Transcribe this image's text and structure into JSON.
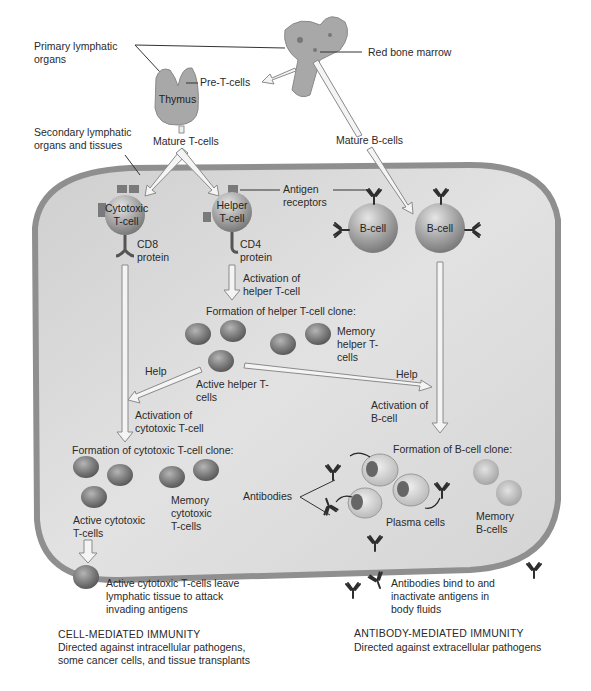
{
  "diagram": {
    "title_context": "Lymphocyte maturation and immune response",
    "colors": {
      "tissue_fill": "#d9d9d9",
      "tissue_border": "#8f8f8f",
      "cell_dark": "#8a8a8a",
      "cell_light": "#c8c8c8",
      "arrow_fill": "#f4f4f4",
      "arrow_stroke": "#8a8a8a",
      "text": "#2a2a2a",
      "background": "#ffffff"
    },
    "top": {
      "primary_organs": "Primary lymphatic organs",
      "red_bone_marrow": "Red bone marrow",
      "pre_t_cells": "Pre-T-cells",
      "thymus": "Thymus",
      "secondary_organs": "Secondary lymphatic organs and tissues",
      "mature_t_cells": "Mature T-cells",
      "mature_b_cells": "Mature B-cells"
    },
    "cells": {
      "cytotoxic_t": "Cytotoxic T-cell",
      "helper_t": "Helper T-cell",
      "b_cell_1": "B-cell",
      "b_cell_2": "B-cell",
      "cd8": "CD8 protein",
      "cd4": "CD4 protein",
      "antigen_receptors": "Antigen receptors"
    },
    "helper_path": {
      "activation": "Activation of helper T-cell",
      "clone_formation": "Formation of helper T-cell clone:",
      "memory": "Memory helper T-cells",
      "active": "Active helper T-cells",
      "help_left": "Help",
      "help_right": "Help"
    },
    "cytotoxic_path": {
      "activation": "Activation of cytotoxic T-cell",
      "clone_formation": "Formation of cytotoxic T-cell clone:",
      "memory": "Memory cytotoxic T-cells",
      "active": "Active cytotoxic T-cells",
      "leave": "Active cytotoxic T-cells leave lymphatic tissue to attack invading antigens"
    },
    "b_path": {
      "activation": "Activation of B-cell",
      "clone_formation": "Formation of B-cell clone:",
      "antibodies": "Antibodies",
      "plasma": "Plasma cells",
      "memory": "Memory B-cells",
      "bind": "Antibodies bind to and inactivate antigens in body fluids"
    },
    "summary": {
      "cell_mediated_title": "CELL-MEDIATED IMMUNITY",
      "cell_mediated_desc": "Directed against intracellular pathogens, some cancer cells, and tissue transplants",
      "antibody_mediated_title": "ANTIBODY-MEDIATED IMMUNITY",
      "antibody_mediated_desc": "Directed against extracellular pathogens"
    }
  }
}
